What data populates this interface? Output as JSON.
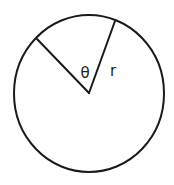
{
  "diagram": {
    "title": "",
    "type": "circle-sector",
    "colors": {
      "stroke": "#1a1a1a",
      "background": "#ffffff",
      "text": "#222222"
    },
    "circle": {
      "cx": 89,
      "cy": 93.5,
      "rx": 75,
      "ry": 78.5
    },
    "center": {
      "x": 89,
      "y": 93
    },
    "radius_lines": [
      {
        "name": "radius-line-right",
        "x2": 115,
        "y2": 21
      },
      {
        "name": "radius-line-left",
        "x2": 37,
        "y2": 39
      }
    ],
    "labels": {
      "angle": "θ",
      "radius": "r"
    }
  }
}
